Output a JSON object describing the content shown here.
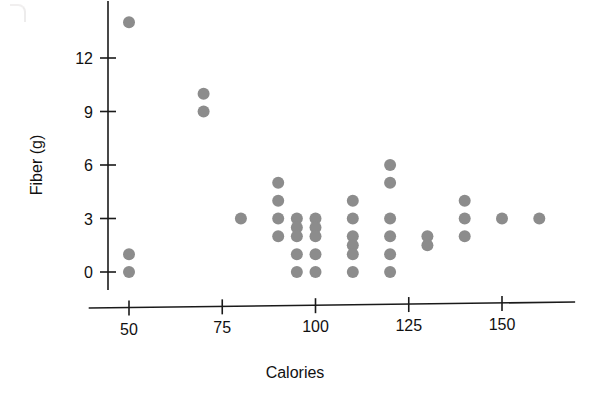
{
  "chart_data": {
    "type": "scatter",
    "title": "",
    "xlabel": "Calories",
    "ylabel": "Fiber (g)",
    "xlim": [
      40,
      168
    ],
    "ylim": [
      -0.9,
      15.2
    ],
    "xticks": [
      50,
      75,
      100,
      125,
      150
    ],
    "xtick_labels": [
      "50",
      "75",
      "100",
      "125",
      "150"
    ],
    "yticks": [
      0,
      3,
      6,
      9,
      12
    ],
    "ytick_labels": [
      "0",
      "3",
      "6",
      "9",
      "12"
    ],
    "grid": false,
    "legend": "none",
    "marker": {
      "shape": "circle",
      "color": "#8c8c8c",
      "size": 6
    },
    "points": [
      {
        "x": 50,
        "y": 14
      },
      {
        "x": 50,
        "y": 1
      },
      {
        "x": 50,
        "y": 0
      },
      {
        "x": 70,
        "y": 10
      },
      {
        "x": 70,
        "y": 9
      },
      {
        "x": 80,
        "y": 3
      },
      {
        "x": 90,
        "y": 5
      },
      {
        "x": 90,
        "y": 4
      },
      {
        "x": 90,
        "y": 3
      },
      {
        "x": 90,
        "y": 2
      },
      {
        "x": 95,
        "y": 3
      },
      {
        "x": 95,
        "y": 2.5
      },
      {
        "x": 95,
        "y": 2
      },
      {
        "x": 95,
        "y": 1
      },
      {
        "x": 95,
        "y": 0
      },
      {
        "x": 100,
        "y": 3
      },
      {
        "x": 100,
        "y": 2.5
      },
      {
        "x": 100,
        "y": 2
      },
      {
        "x": 100,
        "y": 1
      },
      {
        "x": 100,
        "y": 0
      },
      {
        "x": 110,
        "y": 4
      },
      {
        "x": 110,
        "y": 3
      },
      {
        "x": 110,
        "y": 2
      },
      {
        "x": 110,
        "y": 1.5
      },
      {
        "x": 110,
        "y": 1
      },
      {
        "x": 110,
        "y": 0
      },
      {
        "x": 120,
        "y": 6
      },
      {
        "x": 120,
        "y": 5
      },
      {
        "x": 120,
        "y": 3
      },
      {
        "x": 120,
        "y": 2
      },
      {
        "x": 120,
        "y": 1
      },
      {
        "x": 120,
        "y": 0
      },
      {
        "x": 130,
        "y": 2
      },
      {
        "x": 130,
        "y": 1.5
      },
      {
        "x": 140,
        "y": 4
      },
      {
        "x": 140,
        "y": 3
      },
      {
        "x": 140,
        "y": 2
      },
      {
        "x": 150,
        "y": 3
      },
      {
        "x": 160,
        "y": 3
      }
    ]
  }
}
